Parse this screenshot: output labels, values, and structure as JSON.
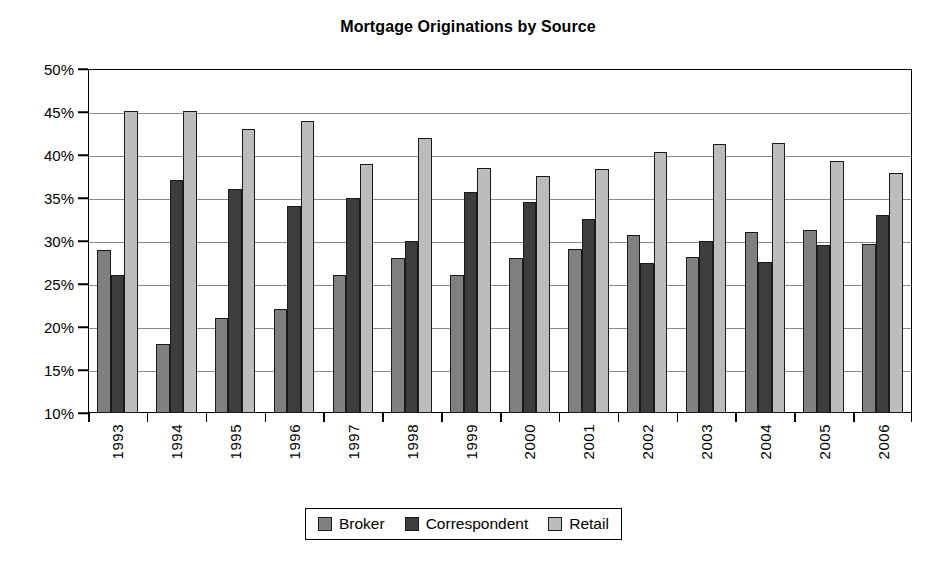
{
  "chart_data": {
    "type": "bar",
    "title": "Mortgage Originations by Source",
    "xlabel": "",
    "ylabel": "",
    "ylim": [
      10,
      50
    ],
    "ytick_step": 5,
    "ytick_labels": [
      "50%",
      "45%",
      "40%",
      "35%",
      "30%",
      "25%",
      "20%",
      "15%",
      "10%"
    ],
    "ytick_values": [
      50,
      45,
      40,
      35,
      30,
      25,
      20,
      15,
      10
    ],
    "grid": true,
    "grid_axis": "y",
    "legend_position": "bottom",
    "units": "percent",
    "categories": [
      "1993",
      "1994",
      "1995",
      "1996",
      "1997",
      "1998",
      "1999",
      "2000",
      "2001",
      "2002",
      "2003",
      "2004",
      "2005",
      "2006"
    ],
    "series": [
      {
        "name": "Broker",
        "color": "#808080",
        "values": [
          29.0,
          18.0,
          21.0,
          22.1,
          26.0,
          28.0,
          26.0,
          28.0,
          29.1,
          30.7,
          28.1,
          31.0,
          31.3,
          29.7
        ]
      },
      {
        "name": "Correspondent",
        "color": "#3d3d3d",
        "values": [
          26.0,
          37.1,
          36.0,
          34.1,
          35.0,
          30.0,
          35.7,
          34.5,
          32.6,
          27.4,
          30.0,
          27.6,
          29.5,
          33.0
        ]
      },
      {
        "name": "Retail",
        "color": "#bcbcbc",
        "values": [
          45.1,
          45.1,
          43.0,
          44.0,
          39.0,
          42.0,
          38.5,
          37.6,
          38.4,
          40.3,
          41.3,
          41.4,
          39.3,
          37.9
        ]
      }
    ]
  },
  "legend": {
    "items": [
      {
        "label": "Broker",
        "color": "#808080"
      },
      {
        "label": "Correspondent",
        "color": "#3d3d3d"
      },
      {
        "label": "Retail",
        "color": "#bcbcbc"
      }
    ]
  }
}
